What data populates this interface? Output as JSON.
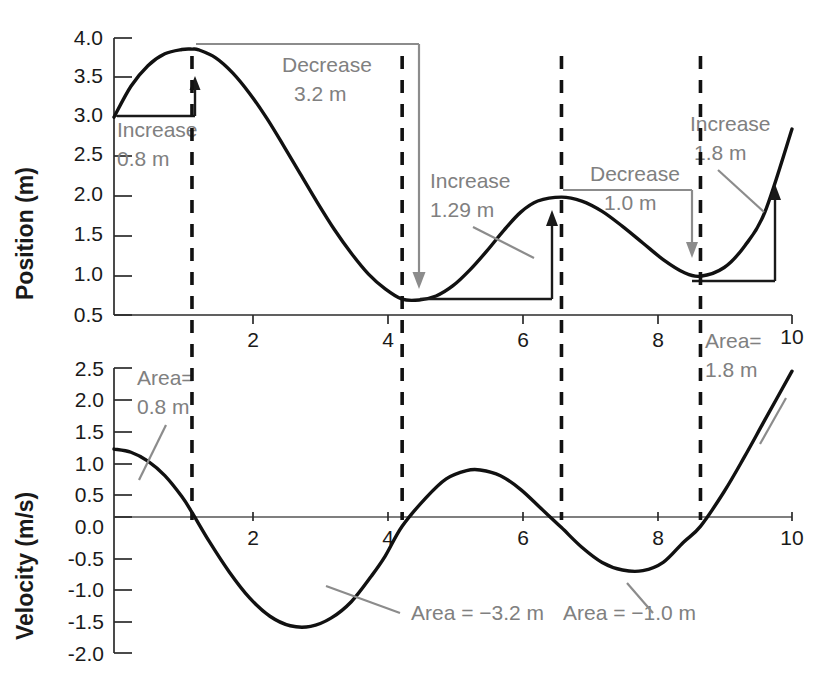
{
  "figure": {
    "title": "",
    "panels": [
      {
        "name": "position-panel",
        "ylabel": "Position (m)",
        "xlabel": "",
        "yticks": [
          "0.5",
          "1.0",
          "1.5",
          "2.0",
          "2.5",
          "3.0",
          "3.5",
          "4.0"
        ],
        "xticks": [
          "2",
          "4",
          "6",
          "8",
          "10"
        ],
        "annotations": [
          {
            "name": "increase-0-8",
            "line1": "Increase",
            "line2": "0.8 m"
          },
          {
            "name": "decrease-3-2",
            "line1": "Decrease",
            "line2": "3.2 m"
          },
          {
            "name": "increase-1-29",
            "line1": "Increase",
            "line2": "1.29 m"
          },
          {
            "name": "decrease-1-0",
            "line1": "Decrease",
            "line2": "1.0 m"
          },
          {
            "name": "increase-1-8",
            "line1": "Increase",
            "line2": "1.8 m"
          }
        ]
      },
      {
        "name": "velocity-panel",
        "ylabel": "Velocity (m/s)",
        "xlabel": "",
        "yticks": [
          "-2.0",
          "-1.5",
          "-1.0",
          "-0.5",
          "0.0",
          "0.5",
          "1.0",
          "1.5",
          "2.0",
          "2.5"
        ],
        "xticks": [
          "2",
          "4",
          "6",
          "8",
          "10"
        ],
        "annotations": [
          {
            "name": "area-0-8",
            "line1": "Area=",
            "line2": "0.8 m"
          },
          {
            "name": "area-neg-3-2",
            "line1": "Area = −3.2 m",
            "line2": ""
          },
          {
            "name": "area-neg-1-0",
            "line1": "Area = −1.0 m",
            "line2": ""
          },
          {
            "name": "area-1-8",
            "line1": "Area=",
            "line2": "1.8 m"
          }
        ]
      }
    ]
  },
  "chart_data": [
    {
      "type": "line",
      "name": "position-vs-time",
      "title": "",
      "xlabel": "",
      "ylabel": "Position (m)",
      "xlim": [
        0,
        10
      ],
      "ylim": [
        0.5,
        4.0
      ],
      "xticks": [
        2,
        4,
        6,
        8,
        10
      ],
      "yticks": [
        0.5,
        1.0,
        1.5,
        2.0,
        2.5,
        3.0,
        3.5,
        4.0
      ],
      "grid": false,
      "legend": null,
      "series": [
        {
          "name": "position",
          "x": [
            0.0,
            0.25,
            0.5,
            0.75,
            1.0,
            1.15,
            1.25,
            1.5,
            1.75,
            2.0,
            2.25,
            2.5,
            2.75,
            3.0,
            3.25,
            3.5,
            3.75,
            4.0,
            4.25,
            4.5,
            4.75,
            5.0,
            5.25,
            5.5,
            5.75,
            6.0,
            6.25,
            6.6,
            6.9,
            7.2,
            7.5,
            7.8,
            8.1,
            8.4,
            8.65,
            9.0,
            9.3,
            9.6,
            10.0
          ],
          "y": [
            3.0,
            3.39,
            3.65,
            3.8,
            3.855,
            3.86,
            3.85,
            3.75,
            3.56,
            3.3,
            2.99,
            2.64,
            2.28,
            1.92,
            1.58,
            1.28,
            1.02,
            0.83,
            0.7,
            0.69,
            0.74,
            0.87,
            1.07,
            1.31,
            1.57,
            1.8,
            1.94,
            1.99,
            1.94,
            1.81,
            1.62,
            1.41,
            1.2,
            1.04,
            0.99,
            1.1,
            1.37,
            1.8,
            2.85
          ]
        }
      ],
      "annotations": [
        {
          "text": "Increase 0.8 m",
          "value": 0.8,
          "from_t": 0.0,
          "to_t": 1.15,
          "from_y": 3.0,
          "to_y": 3.86
        },
        {
          "text": "Decrease 3.2 m",
          "value": -3.2,
          "from_t": 1.15,
          "to_t": 4.25,
          "from_y": 3.86,
          "to_y": 0.69
        },
        {
          "text": "Increase 1.29 m",
          "value": 1.29,
          "from_t": 4.25,
          "to_t": 6.6,
          "from_y": 0.69,
          "to_y": 1.99
        },
        {
          "text": "Decrease 1.0 m",
          "value": -1.0,
          "from_t": 6.6,
          "to_t": 8.65,
          "from_y": 1.99,
          "to_y": 0.99
        },
        {
          "text": "Increase 1.8 m",
          "value": 1.8,
          "from_t": 8.65,
          "to_t": 10.0,
          "from_y": 0.99,
          "to_y": 2.85
        }
      ],
      "vlines": [
        1.15,
        4.25,
        6.6,
        8.65
      ]
    },
    {
      "type": "line",
      "name": "velocity-vs-time",
      "title": "",
      "xlabel": "",
      "ylabel": "Velocity (m/s)",
      "xlim": [
        0,
        10
      ],
      "ylim": [
        -2.0,
        2.5
      ],
      "xticks": [
        2,
        4,
        6,
        8,
        10
      ],
      "yticks": [
        -2.0,
        -1.5,
        -1.0,
        -0.5,
        0.0,
        0.5,
        1.0,
        1.5,
        2.0,
        2.5
      ],
      "grid": false,
      "legend": null,
      "series": [
        {
          "name": "velocity",
          "x": [
            0.0,
            0.25,
            0.5,
            0.75,
            1.0,
            1.15,
            1.4,
            1.7,
            2.0,
            2.3,
            2.6,
            2.9,
            3.2,
            3.5,
            3.8,
            4.0,
            4.25,
            4.6,
            4.9,
            5.2,
            5.4,
            5.7,
            6.0,
            6.3,
            6.6,
            6.9,
            7.2,
            7.5,
            7.8,
            8.1,
            8.4,
            8.65,
            9.0,
            9.3,
            9.6,
            10.0
          ],
          "y": [
            1.22,
            1.17,
            1.03,
            0.8,
            0.47,
            0.22,
            -0.23,
            -0.72,
            -1.13,
            -1.42,
            -1.57,
            -1.58,
            -1.45,
            -1.19,
            -0.78,
            -0.47,
            0.0,
            0.45,
            0.75,
            0.88,
            0.89,
            0.8,
            0.58,
            0.28,
            -0.02,
            -0.33,
            -0.57,
            -0.69,
            -0.7,
            -0.57,
            -0.25,
            0.0,
            0.55,
            1.1,
            1.68,
            2.45
          ]
        }
      ],
      "annotations": [
        {
          "text": "Area= 0.8 m",
          "value": 0.8,
          "from_t": 0.0,
          "to_t": 1.15
        },
        {
          "text": "Area = −3.2 m",
          "value": -3.2,
          "from_t": 1.15,
          "to_t": 4.25
        },
        {
          "text": "Area = −1.0 m",
          "value": -1.0,
          "from_t": 6.6,
          "to_t": 8.65
        },
        {
          "text": "Area= 1.8 m",
          "value": 1.8,
          "from_t": 8.65,
          "to_t": 10.0
        }
      ],
      "vlines": [
        1.15,
        4.25,
        6.6,
        8.65
      ]
    }
  ],
  "colors": {
    "curve": "#111111",
    "annotation_gray": "#8c8c8c",
    "axis": "#2b2b2b",
    "text": "#1a1a1a",
    "background": "#ffffff"
  }
}
